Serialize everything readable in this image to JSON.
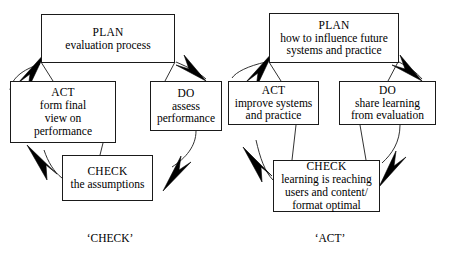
{
  "diagram": {
    "type": "two-pdca-cycles",
    "background_color": "#ffffff",
    "line_color": "#1a1a1a",
    "arrow_color": "#000000",
    "cycles": [
      {
        "id": "check-cycle",
        "caption": "‘CHECK’",
        "nodes": [
          {
            "id": "left-plan",
            "title": "PLAN",
            "desc": "evaluation process"
          },
          {
            "id": "left-do",
            "title": "DO",
            "desc": "assess\nperformance"
          },
          {
            "id": "left-check",
            "title": "CHECK",
            "desc": "the assumptions"
          },
          {
            "id": "left-act",
            "title": "ACT",
            "desc": "form final\nview on\nperformance"
          }
        ],
        "flow": [
          "PLAN",
          "DO",
          "CHECK",
          "ACT",
          "PLAN"
        ]
      },
      {
        "id": "act-cycle",
        "caption": "‘ACT’",
        "nodes": [
          {
            "id": "right-plan",
            "title": "PLAN",
            "desc": "how to influence future\nsystems and practice"
          },
          {
            "id": "right-do",
            "title": "DO",
            "desc": "share learning\nfrom evaluation"
          },
          {
            "id": "right-check",
            "title": "CHECK",
            "desc": "learning is reaching\nusers and content/\nformat optimal"
          },
          {
            "id": "right-act",
            "title": "ACT",
            "desc": "improve systems\nand practice"
          }
        ],
        "flow": [
          "PLAN",
          "DO",
          "CHECK",
          "ACT",
          "PLAN"
        ]
      }
    ]
  }
}
